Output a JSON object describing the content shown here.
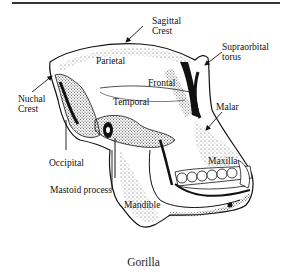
{
  "figure": {
    "caption": "Gorilla"
  },
  "labels": {
    "sagittal_crest": [
      "Sagittal",
      "Crest"
    ],
    "supraorbital_torus": [
      "Supraorbital",
      "torus"
    ],
    "parietal": "Parietal",
    "frontal": "Frontal",
    "nuchal_crest": [
      "Nuchal",
      "Crest"
    ],
    "temporal": "Temporal",
    "malar": "Malar",
    "occipital": "Occipital",
    "maxilla": "Maxilla",
    "mastoid_process": "Mastoid process",
    "mandible": "Mandible"
  },
  "colors": {
    "ink": "#111111",
    "background": "#ffffff",
    "rule": "#333333"
  }
}
